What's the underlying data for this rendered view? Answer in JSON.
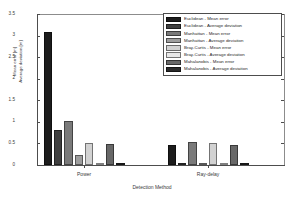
{
  "chart_data": {
    "type": "bar",
    "title": "",
    "xlabel": "Detection Method",
    "ylabel_line1": "Mean error [m]",
    "ylabel_line2": "Average deviation [m]",
    "categories": [
      "Power",
      "Ray-delay"
    ],
    "ylim": [
      0,
      3.5
    ],
    "yticks": [
      "0",
      "0.5",
      "1",
      "1.5",
      "2",
      "2.5",
      "3",
      "3.5"
    ],
    "ytick_values": [
      0,
      0.5,
      1,
      1.5,
      2,
      2.5,
      3,
      3.5
    ],
    "grid": false,
    "legend_position": "top-right",
    "series": [
      {
        "name": "Euclidean - Mean error",
        "color": "#1c1c1c",
        "values": [
          3.08,
          0.47
        ]
      },
      {
        "name": "Euclidean - Average deviation",
        "color": "#3f3f3f",
        "values": [
          0.82,
          0.04
        ]
      },
      {
        "name": "Manhattan - Mean error",
        "color": "#7a7a7a",
        "values": [
          1.02,
          0.53
        ]
      },
      {
        "name": "Manhattan - Average deviation",
        "color": "#9e9e9e",
        "values": [
          0.24,
          0.03
        ]
      },
      {
        "name": "Bray-Curtis - Mean error",
        "color": "#d2d2d2",
        "values": [
          0.52,
          0.52
        ]
      },
      {
        "name": "Bray-Curtis - Average deviation",
        "color": "#e8e8e8",
        "values": [
          0.03,
          0.03
        ]
      },
      {
        "name": "Mahalanobis - Mean error",
        "color": "#686868",
        "values": [
          0.49,
          0.46
        ]
      },
      {
        "name": "Mahalanobis - Average deviation",
        "color": "#2b2b2b",
        "values": [
          0.02,
          0.02
        ]
      }
    ]
  }
}
